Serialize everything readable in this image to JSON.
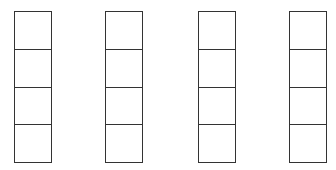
{
  "diagram": {
    "stroke_color": "#333333",
    "background_color": "#ffffff",
    "columns": [
      {
        "index": 1,
        "left": 14,
        "cells": 4
      },
      {
        "index": 2,
        "left": 105,
        "cells": 4
      },
      {
        "index": 3,
        "left": 198,
        "cells": 4
      },
      {
        "index": 4,
        "left": 289,
        "cells": 4
      }
    ]
  }
}
